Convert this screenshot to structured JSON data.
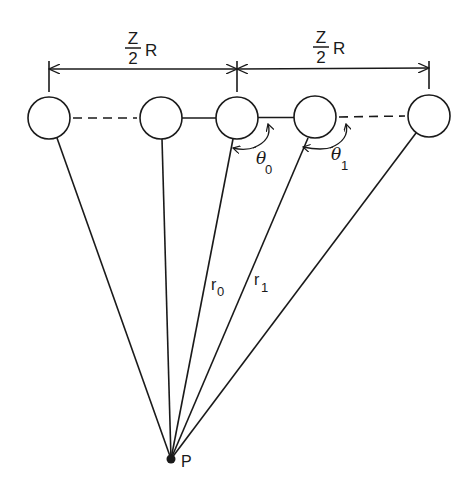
{
  "figure": {
    "type": "diagram",
    "colors": {
      "ink": "#1a1a1a",
      "background": "#ffffff"
    }
  },
  "labels": {
    "left_span": {
      "numerator": "Z",
      "denominator": "2",
      "suffix": "R"
    },
    "right_span": {
      "numerator": "Z",
      "denominator": "2",
      "suffix": "R"
    },
    "r0": {
      "main": "r",
      "sub": "0"
    },
    "r1": {
      "main": "r",
      "sub": "1"
    },
    "theta0": {
      "main": "θ",
      "sub": "0"
    },
    "theta1": {
      "main": "θ",
      "sub": "1"
    },
    "point": "P"
  },
  "atoms": [
    {
      "id": "atom-1",
      "cx": 49,
      "cy": 118
    },
    {
      "id": "atom-2",
      "cx": 161,
      "cy": 118
    },
    {
      "id": "atom-3",
      "cx": 237,
      "cy": 118
    },
    {
      "id": "atom-4",
      "cx": 315,
      "cy": 117
    },
    {
      "id": "atom-5",
      "cx": 429,
      "cy": 116
    }
  ],
  "point_p": {
    "x": 171,
    "y": 459
  }
}
